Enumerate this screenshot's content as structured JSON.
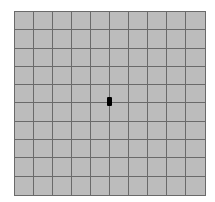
{
  "board": {
    "rows": 10,
    "cols": 10,
    "cell_color": "#bcbcbc",
    "line_color": "#6a6a6a",
    "background": "#ffffff"
  },
  "marker": {
    "shape": "vertical-bar",
    "color": "#000000",
    "x": 107,
    "y": 97,
    "width": 5,
    "height": 9
  }
}
